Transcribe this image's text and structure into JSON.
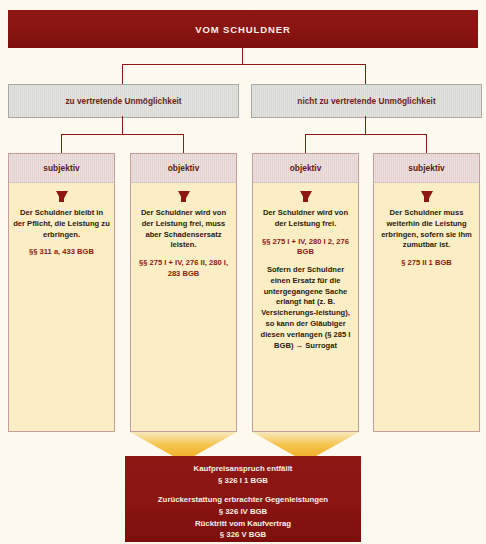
{
  "header": {
    "title": "VOM  SCHULDNER"
  },
  "level2": [
    {
      "label": "zu vertretende Unmöglichkeit"
    },
    {
      "label": "nicht zu vertretende Unmöglichkeit"
    }
  ],
  "columns": [
    {
      "head": "subjektiv",
      "body_text": "Der Schuldner bleibt in der Pflicht, die Leistung zu erbringen.",
      "citation": "§§ 311 a, 433  BGB",
      "extra_text": "",
      "extra_citation": ""
    },
    {
      "head": "objektiv",
      "body_text": "Der Schuldner wird von der Leistung frei, muss aber Schadensersatz leisten.",
      "citation": "§§ 275 I + IV, 276 II, 280 I, 283 BGB",
      "extra_text": "",
      "extra_citation": ""
    },
    {
      "head": "objektiv",
      "body_text": "Der Schuldner wird von der Leistung frei.",
      "citation": "§§ 275 I + IV, 280 I 2, 276 BGB",
      "extra_text": "Sofern der Schuldner einen Ersatz für die untergegangene Sache erlangt hat (z. B. Versicherungs-leistung), so kann der Gläubiger diesen verlangen (§ 285 I BGB) → Surrogat",
      "extra_citation": ""
    },
    {
      "head": "subjektiv",
      "body_text": "Der Schuldner muss weiterhin die Leistung erbringen, sofern sie ihm zumutbar ist.",
      "citation": "§ 275 II 1 BGB",
      "extra_text": "",
      "extra_citation": ""
    }
  ],
  "result": {
    "line1": "Kaufpreisanspruch entfällt",
    "line2": "§ 326 I 1 BGB",
    "line3": "Zurückerstattung erbrachter Gegenleistungen",
    "line4": "§ 326 IV BGB",
    "line5": "Rücktritt vom Kaufvertrag",
    "line6": "§ 326 V BGB"
  },
  "colors": {
    "dark_red": "#8d1713",
    "yellow": "#fbeec4",
    "pink_header": "#e4d2d0",
    "grey_box": "#d8d8d4",
    "funnel_orange": "#f0a81e"
  }
}
